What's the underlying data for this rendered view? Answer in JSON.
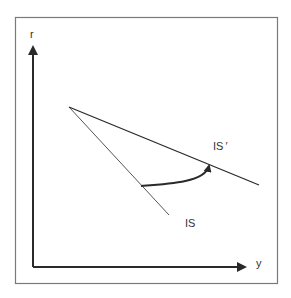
{
  "diagram": {
    "axes": {
      "y_label": "r",
      "x_label": "y"
    },
    "curves": [
      {
        "label": "IS"
      },
      {
        "label": "IS ′"
      }
    ],
    "colors": {
      "frame": "#7a7a7a",
      "line": "#2a2a2a",
      "background": "#ffffff"
    }
  }
}
